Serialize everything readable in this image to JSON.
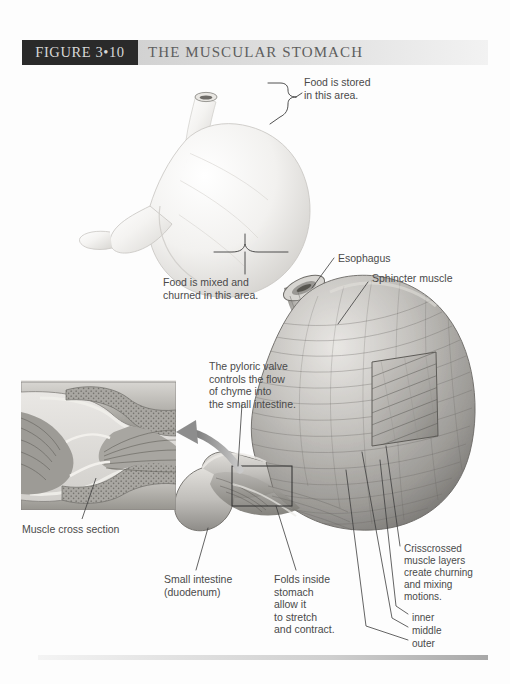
{
  "figure": {
    "tag": "FIGURE 3•10",
    "title": "THE MUSCULAR STOMACH"
  },
  "labels": {
    "food_stored": "Food is stored\nin this area.",
    "food_churned": "Food is mixed and\nchurned in this area.",
    "esophagus": "Esophagus",
    "sphincter_muscle": "Sphincter muscle",
    "pyloric_valve": "The pyloric valve\ncontrols the flow\nof chyme into\nthe small intestine.",
    "muscle_cross_section": "Muscle cross section",
    "small_intestine": "Small intestine\n(duodenum)",
    "folds_inside": "Folds inside\nstomach\nallow it\nto stretch\nand contract.",
    "crisscrossed": "Crisscrossed\nmuscle layers\ncreate churning\nand mixing\nmotions.",
    "layer_inner": "inner",
    "layer_middle": "middle",
    "layer_outer": "outer"
  },
  "colors": {
    "tag_background": "#2a2a2a",
    "tag_text": "#d8d8d8",
    "title_text": "#5e5e5e",
    "band_light": "#f2f2f2",
    "band_dark": "#c9c9c9",
    "label_text": "#4a4a4a",
    "leader_line": "#3c3c3c",
    "organ_light": "#f0efed",
    "organ_mid": "#b8b6b2",
    "organ_dark": "#7d7b78",
    "mucosa": "#9a9894",
    "arrow": "#9c9c9c"
  },
  "illustrations": {
    "top_view": "whole-stomach-exterior",
    "main_view": "stomach-cutaway-muscle-layers",
    "inset_view": "pyloric-valve-cross-section"
  }
}
